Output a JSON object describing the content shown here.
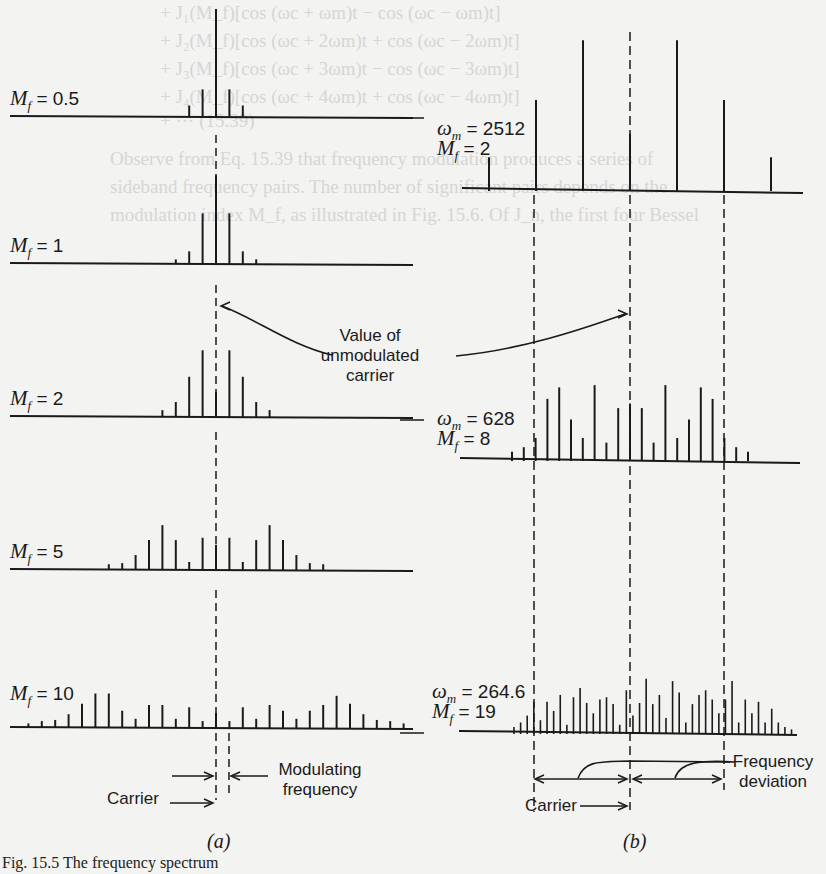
{
  "figure": {
    "caption": "Fig. 15.5  The frequency spectrum",
    "panel_a_tag": "(a)",
    "panel_b_tag": "(b)"
  },
  "bleed_through_text": [
    "+ J₁(M_f)[cos (ωc + ωm)t − cos (ωc − ωm)t]",
    "+ J₂(M_f)[cos (ωc + 2ωm)t + cos (ωc − 2ωm)t]",
    "+ J₃(M_f)[cos (ωc + 3ωm)t − cos (ωc − 3ωm)t]",
    "+ J₄(M_f)[cos (ωc + 4ωm)t + cos (ωc − 4ωm)t]",
    "+ ···                                    (15.39)",
    "Observe from Eq. 15.39 that frequency modulation produces a series of",
    "sideband frequency pairs. The number of significant pairs depends on the",
    "modulation index M_f, as illustrated in Fig. 15.6. Of J_n, the first four Bessel"
  ],
  "labels": {
    "a": [
      {
        "name": "mf-0.5-label",
        "var": "M",
        "sub": "f",
        "value": "= 0.5",
        "x": 10,
        "y": 88
      },
      {
        "name": "mf-1-label",
        "var": "M",
        "sub": "f",
        "value": "= 1",
        "x": 10,
        "y": 235
      },
      {
        "name": "mf-2-label",
        "var": "M",
        "sub": "f",
        "value": "= 2",
        "x": 10,
        "y": 388
      },
      {
        "name": "mf-5-label",
        "var": "M",
        "sub": "f",
        "value": "= 5",
        "x": 10,
        "y": 541
      },
      {
        "name": "mf-10-label",
        "var": "M",
        "sub": "f",
        "value": "= 10",
        "x": 10,
        "y": 683
      }
    ],
    "b": [
      {
        "name": "wm-2512-label",
        "line1": "= 2512",
        "line2": "= 2",
        "x": 437,
        "y": 120
      },
      {
        "name": "wm-628-label",
        "line1": "= 628",
        "line2": "= 8",
        "x": 437,
        "y": 410
      },
      {
        "name": "wm-264-label",
        "line1": "= 264.6",
        "line2": "= 19",
        "x": 432,
        "y": 683
      }
    ],
    "omega_m": "ω",
    "omega_sub": "m",
    "m_var": "M",
    "m_sub": "f"
  },
  "annotations": {
    "unmodulated": [
      "Value of",
      "unmodulated",
      "carrier"
    ],
    "modulating": [
      "Modulating",
      "frequency"
    ],
    "carrier_a": "Carrier",
    "carrier_b": "Carrier",
    "deviation": [
      "Frequency",
      "deviation"
    ]
  },
  "chart_data": [
    {
      "type": "bar",
      "title": "(a) FM spectra, constant modulating frequency",
      "description": "Line spectra of FM signal for increasing modulation index; relative amplitudes estimated from line heights (|J_n(M_f)|)",
      "series": [
        {
          "name": "M_f = 0.5",
          "orders": [
            -2,
            -1,
            0,
            1,
            2
          ],
          "heights": [
            0.1,
            0.24,
            0.94,
            0.24,
            0.1
          ]
        },
        {
          "name": "M_f = 1",
          "orders": [
            -3,
            -2,
            -1,
            0,
            1,
            2,
            3
          ],
          "heights": [
            0.04,
            0.11,
            0.44,
            0.77,
            0.44,
            0.11,
            0.04
          ]
        },
        {
          "name": "M_f = 2",
          "orders": [
            -4,
            -3,
            -2,
            -1,
            0,
            1,
            2,
            3,
            4
          ],
          "heights": [
            0.06,
            0.13,
            0.35,
            0.58,
            0.22,
            0.58,
            0.35,
            0.13,
            0.06
          ]
        },
        {
          "name": "M_f = 5",
          "orders": [
            -8,
            -7,
            -6,
            -5,
            -4,
            -3,
            -2,
            -1,
            0,
            1,
            2,
            3,
            4,
            5,
            6,
            7,
            8
          ],
          "heights": [
            0.05,
            0.06,
            0.13,
            0.26,
            0.39,
            0.26,
            0.07,
            0.28,
            0.22,
            0.28,
            0.07,
            0.26,
            0.39,
            0.26,
            0.13,
            0.06,
            0.05
          ]
        },
        {
          "name": "M_f = 10",
          "orders": [
            -14,
            -13,
            -12,
            -11,
            -10,
            -9,
            -8,
            -7,
            -6,
            -5,
            -4,
            -3,
            -2,
            -1,
            0,
            1,
            2,
            3,
            4,
            5,
            6,
            7,
            8,
            9,
            10,
            11,
            12,
            13,
            14
          ],
          "heights": [
            0.04,
            0.06,
            0.07,
            0.12,
            0.21,
            0.3,
            0.3,
            0.15,
            0.08,
            0.2,
            0.2,
            0.08,
            0.18,
            0.06,
            0.13,
            0.06,
            0.18,
            0.08,
            0.2,
            0.15,
            0.08,
            0.15,
            0.2,
            0.28,
            0.21,
            0.12,
            0.07,
            0.06,
            0.04
          ]
        }
      ],
      "annotations": [
        "Carrier",
        "Modulating frequency",
        "Value of unmodulated carrier"
      ]
    },
    {
      "type": "bar",
      "title": "(b) FM spectra, constant frequency deviation",
      "series": [
        {
          "name": "ωm = 2512, M_f = 2",
          "orders": [
            -3,
            -2,
            -1,
            0,
            1,
            2,
            3
          ],
          "heights": [
            0.13,
            0.35,
            0.58,
            0.22,
            0.58,
            0.35,
            0.13
          ]
        },
        {
          "name": "ωm = 628, M_f = 8",
          "orders": [
            -10,
            -9,
            -8,
            -7,
            -6,
            -5,
            -4,
            -3,
            -2,
            -1,
            0,
            1,
            2,
            3,
            4,
            5,
            6,
            7,
            8,
            9,
            10,
            11,
            12
          ],
          "heights": [
            0.04,
            0.06,
            0.1,
            0.27,
            0.32,
            0.18,
            0.1,
            0.33,
            0.08,
            0.23,
            0.25,
            0.23,
            0.08,
            0.33,
            0.1,
            0.18,
            0.32,
            0.27,
            0.1,
            0.06,
            0.04
          ]
        },
        {
          "name": "ωm = 264.6, M_f = 19",
          "orders": "approx. -22..+22",
          "heights": "dense comb, max ≈ 0.25"
        }
      ],
      "annotations": [
        "Carrier",
        "Frequency deviation",
        "Value of unmodulated carrier"
      ]
    }
  ]
}
